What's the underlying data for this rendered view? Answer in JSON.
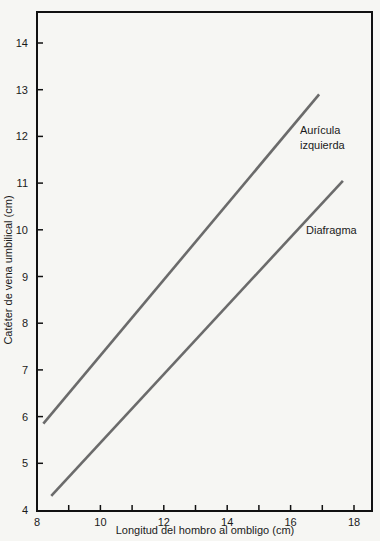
{
  "chart_data": {
    "type": "line",
    "title": "",
    "xlabel": "Longitud del hombro al ombligo (cm)",
    "ylabel": "Catéter de vena umbilical (cm)",
    "xlim": [
      8,
      18.5
    ],
    "ylim": [
      4,
      14.6
    ],
    "x_ticks": [
      8,
      10,
      12,
      14,
      16,
      18
    ],
    "x_minor_ticks": [
      9,
      11,
      13,
      15,
      17
    ],
    "y_ticks": [
      4,
      5,
      6,
      7,
      8,
      9,
      10,
      11,
      12,
      13,
      14
    ],
    "grid": false,
    "legend": "inline labels",
    "series": [
      {
        "name": "Aurícula izquierda",
        "label_lines": [
          "Aurícula",
          "izquierda"
        ],
        "x": [
          8.2,
          16.9
        ],
        "y": [
          5.85,
          12.9
        ],
        "color": "#6b6b6b"
      },
      {
        "name": "Diafragma",
        "label_lines": [
          "Diafragma"
        ],
        "x": [
          8.45,
          17.65
        ],
        "y": [
          4.3,
          11.05
        ],
        "color": "#6b6b6b"
      }
    ]
  }
}
